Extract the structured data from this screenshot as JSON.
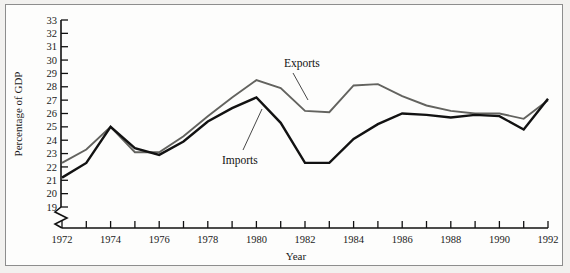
{
  "chart_data": {
    "type": "line",
    "title": "",
    "xlabel": "Year",
    "ylabel": "Percentage of GDP",
    "xlim": [
      1972,
      1992
    ],
    "ylim": [
      19,
      33
    ],
    "y_axis_broken_below": 19,
    "grid": false,
    "legend_position": "inline-annotations",
    "x": [
      1972,
      1973,
      1974,
      1975,
      1976,
      1977,
      1978,
      1979,
      1980,
      1981,
      1982,
      1983,
      1984,
      1985,
      1986,
      1987,
      1988,
      1989,
      1990,
      1991,
      1992
    ],
    "x_tick_labels": [
      "1972",
      "",
      "1974",
      "",
      "1976",
      "",
      "1978",
      "",
      "1980",
      "",
      "1982",
      "",
      "1984",
      "",
      "1986",
      "",
      "1988",
      "",
      "1990",
      "",
      "1992"
    ],
    "y_tick_labels": [
      "19",
      "20",
      "21",
      "22",
      "23",
      "24",
      "25",
      "26",
      "27",
      "28",
      "29",
      "30",
      "31",
      "32",
      "33"
    ],
    "y_ticks": [
      19,
      20,
      21,
      22,
      23,
      24,
      25,
      26,
      27,
      28,
      29,
      30,
      31,
      32,
      33
    ],
    "series": [
      {
        "name": "Exports",
        "color": "#63635f",
        "values": [
          22.3,
          23.3,
          25.0,
          23.1,
          23.1,
          24.3,
          25.8,
          27.2,
          28.5,
          27.9,
          26.2,
          26.1,
          28.1,
          28.2,
          27.3,
          26.6,
          26.2,
          26.0,
          26.0,
          25.6,
          27.0
        ]
      },
      {
        "name": "Imports",
        "color": "#121212",
        "values": [
          21.2,
          22.3,
          25.0,
          23.4,
          22.9,
          23.9,
          25.4,
          26.4,
          27.2,
          25.3,
          22.3,
          22.3,
          24.1,
          25.2,
          26.0,
          25.9,
          25.7,
          25.9,
          25.8,
          24.8,
          27.1
        ]
      }
    ],
    "annotations": [
      {
        "text": "Exports",
        "series": "Exports"
      },
      {
        "text": "Imports",
        "series": "Imports"
      }
    ]
  }
}
